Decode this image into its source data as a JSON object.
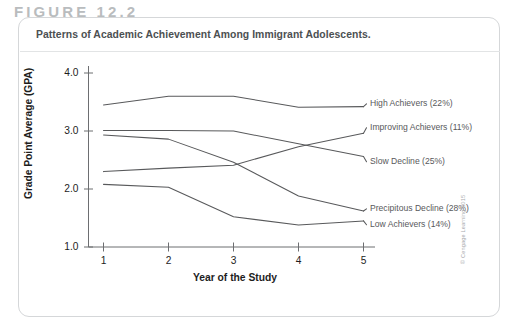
{
  "figure": {
    "number_label": "FIGURE 12.2",
    "caption": "Patterns of Academic Achievement Among Immigrant Adolescents.",
    "credit": "© Cengage Learning 2015"
  },
  "chart_data": {
    "type": "line",
    "title": "Patterns of Academic Achievement Among Immigrant Adolescents.",
    "xlabel": "Year of the Study",
    "ylabel": "Grade Point Average (GPA)",
    "x": [
      1,
      2,
      3,
      4,
      5
    ],
    "xtick_labels": [
      "1",
      "2",
      "3",
      "4",
      "5"
    ],
    "ytick_labels": [
      "1.0",
      "2.0",
      "3.0",
      "4.0"
    ],
    "yticks": [
      1.0,
      2.0,
      3.0,
      4.0
    ],
    "xlim": [
      0.72,
      5.28
    ],
    "ylim": [
      1.0,
      4.0
    ],
    "grid": false,
    "legend_position": "right-inline",
    "line_color": "#58595b",
    "series": [
      {
        "name": "High Achievers",
        "percent": "22%",
        "label": "High Achievers (22%)",
        "values": [
          3.45,
          3.6,
          3.6,
          3.41,
          3.42
        ]
      },
      {
        "name": "Improving Achievers",
        "percent": "11%",
        "label": "Improving Achievers (11%)",
        "values": [
          2.3,
          2.36,
          2.41,
          2.73,
          2.96
        ]
      },
      {
        "name": "Slow Decline",
        "percent": "25%",
        "label": "Slow Decline (25%)",
        "values": [
          3.01,
          3.01,
          3.0,
          2.78,
          2.56
        ]
      },
      {
        "name": "Precipitous Decline",
        "percent": "28%",
        "label": "Precipitous Decline (28%)",
        "values": [
          2.93,
          2.86,
          2.46,
          1.88,
          1.62
        ]
      },
      {
        "name": "Low Achievers",
        "percent": "14%",
        "label": "Low Achievers (14%)",
        "values": [
          2.08,
          2.03,
          1.52,
          1.38,
          1.45
        ]
      }
    ]
  }
}
